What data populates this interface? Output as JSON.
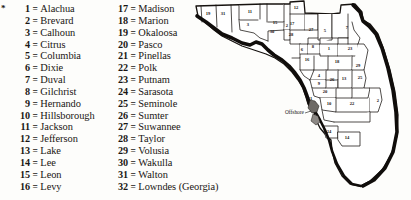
{
  "figure": {
    "background_color": "#fdfdfb",
    "ink_color": "#16120f"
  },
  "legend": {
    "footnote_marker": "*",
    "separator": "=",
    "column_left": [
      {
        "number": "1",
        "name": "Alachua"
      },
      {
        "number": "2",
        "name": "Brevard"
      },
      {
        "number": "3",
        "name": "Calhoun"
      },
      {
        "number": "4",
        "name": "Citrus"
      },
      {
        "number": "5",
        "name": "Columbia"
      },
      {
        "number": "6",
        "name": "Dixie"
      },
      {
        "number": "7",
        "name": "Duval"
      },
      {
        "number": "8",
        "name": "Gilchrist"
      },
      {
        "number": "9",
        "name": "Hernando"
      },
      {
        "number": "10",
        "name": "Hillsborough"
      },
      {
        "number": "11",
        "name": "Jackson"
      },
      {
        "number": "12",
        "name": "Jefferson"
      },
      {
        "number": "13",
        "name": "Lake"
      },
      {
        "number": "14",
        "name": "Lee"
      },
      {
        "number": "15",
        "name": "Leon"
      },
      {
        "number": "16",
        "name": "Levy"
      }
    ],
    "column_right": [
      {
        "number": "17",
        "name": "Madison"
      },
      {
        "number": "18",
        "name": "Marion"
      },
      {
        "number": "19",
        "name": "Okaloosa"
      },
      {
        "number": "20",
        "name": "Pasco"
      },
      {
        "number": "21",
        "name": "Pinellas"
      },
      {
        "number": "22",
        "name": "Polk"
      },
      {
        "number": "23",
        "name": "Putnam"
      },
      {
        "number": "24",
        "name": "Sarasota"
      },
      {
        "number": "25",
        "name": "Seminole"
      },
      {
        "number": "26",
        "name": "Sumter"
      },
      {
        "number": "27",
        "name": "Suwannee"
      },
      {
        "number": "28",
        "name": "Taylor"
      },
      {
        "number": "29",
        "name": "Volusia"
      },
      {
        "number": "30",
        "name": "Wakulla"
      },
      {
        "number": "31",
        "name": "Walton"
      },
      {
        "number": "32",
        "name": "Lowndes (Georgia)"
      }
    ]
  },
  "map": {
    "offshore_label": "Offshore",
    "county_markers": [
      {
        "number": "19",
        "x": 16,
        "y": 14
      },
      {
        "number": "31",
        "x": 31,
        "y": 14
      },
      {
        "number": "11",
        "x": 58,
        "y": 12
      },
      {
        "number": "3",
        "x": 56,
        "y": 25
      },
      {
        "number": "12",
        "x": 104,
        "y": 8
      },
      {
        "number": "15",
        "x": 83,
        "y": 23
      },
      {
        "number": "30",
        "x": 80,
        "y": 32
      },
      {
        "number": "2",
        "x": 95,
        "y": 26
      },
      {
        "number": "28",
        "x": 99,
        "y": 35
      },
      {
        "number": "17",
        "x": 100,
        "y": 24
      },
      {
        "number": "27",
        "x": 119,
        "y": 30
      },
      {
        "number": "5",
        "x": 133,
        "y": 31
      },
      {
        "number": "7",
        "x": 155,
        "y": 28
      },
      {
        "number": "6",
        "x": 110,
        "y": 50
      },
      {
        "number": "8",
        "x": 121,
        "y": 47
      },
      {
        "number": "1",
        "x": 137,
        "y": 49
      },
      {
        "number": "23",
        "x": 158,
        "y": 49
      },
      {
        "number": "16",
        "x": 115,
        "y": 60
      },
      {
        "number": "18",
        "x": 145,
        "y": 62
      },
      {
        "number": "29",
        "x": 166,
        "y": 66
      },
      {
        "number": "4",
        "x": 127,
        "y": 76
      },
      {
        "number": "26",
        "x": 140,
        "y": 80
      },
      {
        "number": "13",
        "x": 152,
        "y": 79
      },
      {
        "number": "25",
        "x": 168,
        "y": 78
      },
      {
        "number": "9",
        "x": 127,
        "y": 84
      },
      {
        "number": "20",
        "x": 133,
        "y": 92
      },
      {
        "number": "21",
        "x": 118,
        "y": 99
      },
      {
        "number": "10",
        "x": 137,
        "y": 104
      },
      {
        "number": "22",
        "x": 160,
        "y": 104
      },
      {
        "number": "2",
        "x": 186,
        "y": 101
      },
      {
        "number": "24",
        "x": 137,
        "y": 132
      },
      {
        "number": "14",
        "x": 155,
        "y": 138
      }
    ]
  }
}
